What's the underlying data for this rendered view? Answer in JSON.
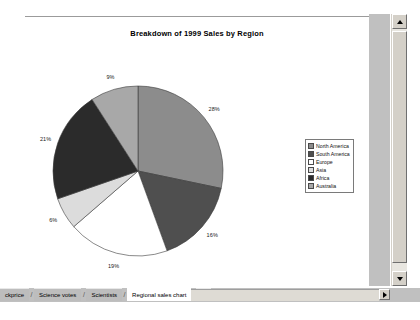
{
  "window": {
    "kind": "spreadsheet-chart-sheet"
  },
  "chart_data": {
    "type": "pie",
    "title": "Breakdown of 1999 Sales by Region",
    "xlabel": "",
    "ylabel": "",
    "grid": false,
    "legend_position": "right",
    "data_labels": "percentage",
    "categories": [
      "North America",
      "South America",
      "Europe",
      "Asia",
      "Africa",
      "Australia"
    ],
    "values": [
      28,
      16,
      19,
      6,
      21,
      9
    ],
    "labels": [
      "28%",
      "16%",
      "19%",
      "6%",
      "21%",
      "9%"
    ],
    "slice_colors": [
      "#8c8c8c",
      "#4f4f4f",
      "#ffffff",
      "#dcdcdc",
      "#2b2b2b",
      "#a8a8a8"
    ],
    "start_angle": 0,
    "direction": "clockwise"
  },
  "legend": {
    "entries": [
      {
        "label": "North America",
        "color": "#8c8c8c"
      },
      {
        "label": "South America",
        "color": "#4f4f4f"
      },
      {
        "label": "Europe",
        "color": "#ffffff"
      },
      {
        "label": "Asia",
        "color": "#dcdcdc"
      },
      {
        "label": "Africa",
        "color": "#2b2b2b"
      },
      {
        "label": "Australia",
        "color": "#a8a8a8"
      }
    ]
  },
  "sheet_tabs": {
    "tabs": [
      {
        "label": "ckprice",
        "active": false
      },
      {
        "label": "Science votes",
        "active": false
      },
      {
        "label": "Scientists",
        "active": false
      },
      {
        "label": "Regional sales chart",
        "active": true
      },
      {
        "label": "R",
        "active": false
      }
    ],
    "separator": "/",
    "scroll_left_icon": "triangle-left-icon",
    "scroll_right_icon": "triangle-right-icon"
  },
  "scrollbars": {
    "vertical_up_icon": "triangle-up-icon",
    "vertical_down_icon": "triangle-down-icon"
  }
}
